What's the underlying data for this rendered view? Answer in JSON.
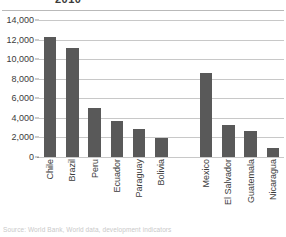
{
  "chart_data": {
    "type": "bar",
    "title": "2010",
    "title_note": "title row is cropped off the top of the screenshot",
    "xlabel": "",
    "ylabel": "",
    "ylim": [
      0,
      14000
    ],
    "ytick_step": 2000,
    "ytick_labels": [
      "14,000",
      "12,000",
      "10,000",
      "8,000",
      "6,000",
      "4,000",
      "2,000",
      "0"
    ],
    "ytick_values": [
      14000,
      12000,
      10000,
      8000,
      6000,
      4000,
      2000,
      0
    ],
    "grid": true,
    "legend": "none",
    "bar_color": "#595959",
    "gap_after_index": 5,
    "categories": [
      "Chile",
      "Brazil",
      "Peru",
      "Ecuador",
      "Paraguay",
      "Bolivia",
      "Mexico",
      "El Salvador",
      "Guatemala",
      "Nicaragua"
    ],
    "values": [
      12250,
      11100,
      5000,
      3700,
      2900,
      1950,
      8600,
      3300,
      2700,
      950
    ]
  },
  "source": {
    "text": "Source: World Bank, World data, development indicators"
  }
}
